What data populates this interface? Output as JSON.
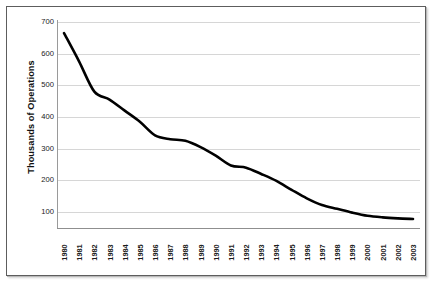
{
  "chart_data": {
    "type": "line",
    "title": "",
    "xlabel": "",
    "ylabel": "Thousands of Operations",
    "ylim": [
      0,
      700
    ],
    "yticks": [
      700,
      600,
      500,
      400,
      300,
      200,
      100
    ],
    "grid": true,
    "legend": false,
    "line_color": "#000000",
    "grid_color": "#d6d6d6",
    "categories": [
      "1980",
      "1981",
      "1982",
      "1983",
      "1984",
      "1985",
      "1986",
      "1987",
      "1988",
      "1989",
      "1990",
      "1991",
      "1992",
      "1993",
      "1994",
      "1995",
      "1996",
      "1997",
      "1998",
      "1999",
      "2000",
      "2001",
      "2002",
      "2003"
    ],
    "values": [
      665,
      575,
      480,
      455,
      420,
      385,
      342,
      330,
      325,
      305,
      278,
      247,
      240,
      220,
      198,
      170,
      143,
      122,
      110,
      98,
      88,
      83,
      80,
      78
    ],
    "series": [
      {
        "name": "Operations",
        "values": [
          665,
          575,
          480,
          455,
          420,
          385,
          342,
          330,
          325,
          305,
          278,
          247,
          240,
          220,
          198,
          170,
          143,
          122,
          110,
          98,
          88,
          83,
          80,
          78
        ]
      }
    ]
  },
  "axes": {
    "ylabel_text": "Thousands of Operations",
    "ytick_labels": [
      "700",
      "600",
      "500",
      "400",
      "300",
      "200",
      "100"
    ],
    "xtick_labels": [
      "1980",
      "1981",
      "1982",
      "1983",
      "1984",
      "1985",
      "1986",
      "1987",
      "1988",
      "1989",
      "1990",
      "1991",
      "1992",
      "1993",
      "1994",
      "1995",
      "1996",
      "1997",
      "1998",
      "1999",
      "2000",
      "2001",
      "2002",
      "2003"
    ]
  }
}
